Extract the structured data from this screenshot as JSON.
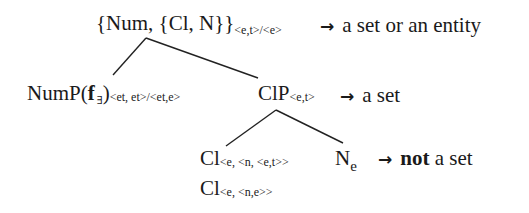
{
  "diagram": {
    "type": "syntax-tree",
    "root": {
      "label": "{Num, {Cl, N}}",
      "type_subscript": "<e,t>/<e>",
      "arrow": "→",
      "gloss": "a set or an entity"
    },
    "numP": {
      "label_prefix": "NumP(",
      "f": "f",
      "f_subscript": "∃",
      "label_suffix": ")",
      "type_subscript": "<et, et>/<et,e>"
    },
    "clP": {
      "label": "ClP",
      "type_subscript": "<e,t>",
      "arrow": "→",
      "gloss": "a set"
    },
    "cl1": {
      "label": "Cl",
      "type_subscript": "<e, <n, <e,t>>"
    },
    "cl2": {
      "label": "Cl",
      "type_subscript": "<e, <n,e>>"
    },
    "n": {
      "label": "N",
      "type_subscript": "e",
      "arrow": "→",
      "gloss_bold": "not",
      "gloss_rest": " a set"
    },
    "edges": [
      {
        "from": "root",
        "to": "numP",
        "x1": 146,
        "y1": 38,
        "x2": 113,
        "y2": 75
      },
      {
        "from": "root",
        "to": "clP",
        "x1": 146,
        "y1": 38,
        "x2": 258,
        "y2": 78
      },
      {
        "from": "clP",
        "to": "cl",
        "x1": 276,
        "y1": 110,
        "x2": 226,
        "y2": 146
      },
      {
        "from": "clP",
        "to": "n",
        "x1": 276,
        "y1": 110,
        "x2": 343,
        "y2": 143
      }
    ]
  }
}
